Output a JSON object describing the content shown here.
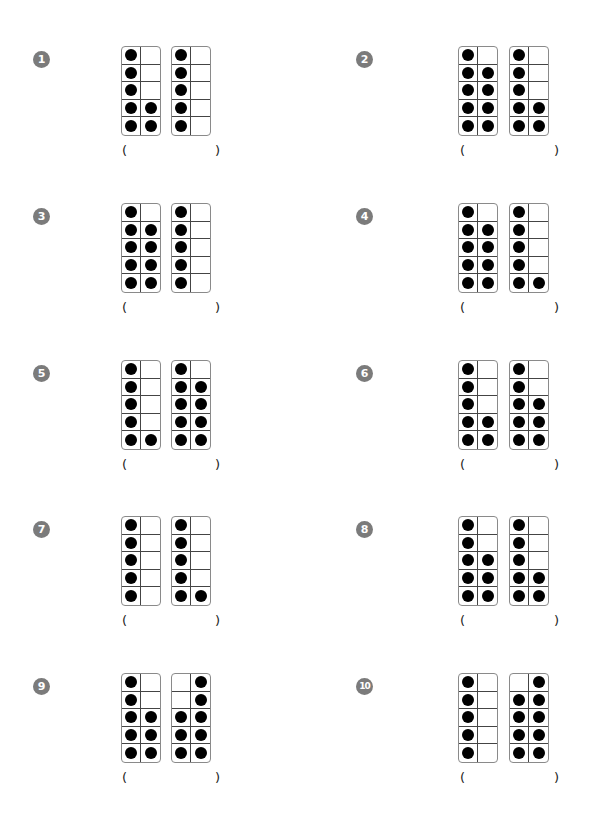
{
  "problems": [
    {
      "number": "1",
      "left": {
        "count": 7,
        "cells": [
          1,
          0,
          1,
          0,
          1,
          0,
          1,
          1,
          1,
          1
        ]
      },
      "right": {
        "count": 5,
        "cells": [
          1,
          0,
          1,
          0,
          1,
          0,
          1,
          0,
          1,
          0
        ]
      },
      "answer": ""
    },
    {
      "number": "2",
      "left": {
        "count": 9,
        "cells": [
          1,
          0,
          1,
          1,
          1,
          1,
          1,
          1,
          1,
          1
        ]
      },
      "right": {
        "count": 7,
        "cells": [
          1,
          0,
          1,
          0,
          1,
          0,
          1,
          1,
          1,
          1
        ]
      },
      "answer": ""
    },
    {
      "number": "3",
      "left": {
        "count": 9,
        "cells": [
          1,
          0,
          1,
          1,
          1,
          1,
          1,
          1,
          1,
          1
        ]
      },
      "right": {
        "count": 5,
        "cells": [
          1,
          0,
          1,
          0,
          1,
          0,
          1,
          0,
          1,
          0
        ]
      },
      "answer": ""
    },
    {
      "number": "4",
      "left": {
        "count": 9,
        "cells": [
          1,
          0,
          1,
          1,
          1,
          1,
          1,
          1,
          1,
          1
        ]
      },
      "right": {
        "count": 6,
        "cells": [
          1,
          0,
          1,
          0,
          1,
          0,
          1,
          0,
          1,
          1
        ]
      },
      "answer": ""
    },
    {
      "number": "5",
      "left": {
        "count": 6,
        "cells": [
          1,
          0,
          1,
          0,
          1,
          0,
          1,
          0,
          1,
          1
        ]
      },
      "right": {
        "count": 9,
        "cells": [
          1,
          0,
          1,
          1,
          1,
          1,
          1,
          1,
          1,
          1
        ]
      },
      "answer": ""
    },
    {
      "number": "6",
      "left": {
        "count": 7,
        "cells": [
          1,
          0,
          1,
          0,
          1,
          0,
          1,
          1,
          1,
          1
        ]
      },
      "right": {
        "count": 8,
        "cells": [
          1,
          0,
          1,
          0,
          1,
          1,
          1,
          1,
          1,
          1
        ]
      },
      "answer": ""
    },
    {
      "number": "7",
      "left": {
        "count": 5,
        "cells": [
          1,
          0,
          1,
          0,
          1,
          0,
          1,
          0,
          1,
          0
        ]
      },
      "right": {
        "count": 6,
        "cells": [
          1,
          0,
          1,
          0,
          1,
          0,
          1,
          0,
          1,
          1
        ]
      },
      "answer": ""
    },
    {
      "number": "8",
      "left": {
        "count": 8,
        "cells": [
          1,
          0,
          1,
          0,
          1,
          1,
          1,
          1,
          1,
          1
        ]
      },
      "right": {
        "count": 7,
        "cells": [
          1,
          0,
          1,
          0,
          1,
          0,
          1,
          1,
          1,
          1
        ]
      },
      "answer": ""
    },
    {
      "number": "9",
      "left": {
        "count": 8,
        "cells": [
          1,
          0,
          1,
          0,
          1,
          1,
          1,
          1,
          1,
          1
        ]
      },
      "right": {
        "count": 8,
        "cells": [
          0,
          1,
          0,
          1,
          1,
          1,
          1,
          1,
          1,
          1
        ]
      },
      "answer": ""
    },
    {
      "number": "10",
      "left": {
        "count": 5,
        "cells": [
          1,
          0,
          1,
          0,
          1,
          0,
          1,
          0,
          1,
          0
        ]
      },
      "right": {
        "count": 9,
        "cells": [
          0,
          1,
          1,
          1,
          1,
          1,
          1,
          1,
          1,
          1
        ]
      },
      "answer": ""
    }
  ],
  "paren_open": "(",
  "paren_close": ")",
  "colors": {
    "badge": "#7b7b7b",
    "dot": "#000000",
    "frame_border": "#8a8a8a"
  }
}
